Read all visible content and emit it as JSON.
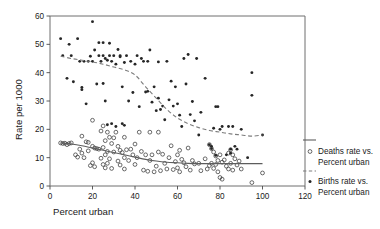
{
  "chart_data": {
    "type": "scatter",
    "title": "",
    "xlabel": "Percent urban",
    "ylabel": "Rate per 1000",
    "xlim": [
      0,
      120
    ],
    "ylim": [
      0,
      60
    ],
    "xticks": [
      0,
      20,
      40,
      60,
      80,
      100,
      120
    ],
    "yticks": [
      0,
      10,
      20,
      30,
      40,
      50,
      60
    ],
    "xtick_labels": [
      "0",
      "20",
      "40",
      "60",
      "80",
      "100",
      "120"
    ],
    "ytick_labels": [
      "0",
      "10",
      "20",
      "30",
      "40",
      "50",
      "60"
    ],
    "grid": false,
    "legend_position": "right",
    "series": [
      {
        "name": "Deaths rate vs. Percent urban",
        "marker": "open-circle",
        "line_style": "solid",
        "points": [
          [
            5,
            15.2
          ],
          [
            6,
            15.0
          ],
          [
            7,
            15.1
          ],
          [
            8,
            14.6
          ],
          [
            9,
            15.0
          ],
          [
            10,
            15.2
          ],
          [
            12,
            11.0
          ],
          [
            13,
            10.2
          ],
          [
            14,
            13.0
          ],
          [
            15,
            17.6
          ],
          [
            15,
            11.6
          ],
          [
            16,
            10.0
          ],
          [
            17,
            15.6
          ],
          [
            18,
            15.4
          ],
          [
            18,
            12.4
          ],
          [
            19,
            7.2
          ],
          [
            20,
            23.2
          ],
          [
            20,
            8.2
          ],
          [
            20,
            14.0
          ],
          [
            21,
            13.4
          ],
          [
            21,
            6.8
          ],
          [
            22,
            13.2
          ],
          [
            23,
            13.0
          ],
          [
            24,
            19.4
          ],
          [
            24,
            9.8
          ],
          [
            25,
            21.2
          ],
          [
            25,
            13.6
          ],
          [
            25,
            7.6
          ],
          [
            26,
            16.0
          ],
          [
            26,
            11.0
          ],
          [
            26,
            6.4
          ],
          [
            27,
            19.0
          ],
          [
            27,
            12.2
          ],
          [
            27,
            8.0
          ],
          [
            28,
            17.2
          ],
          [
            28,
            9.6
          ],
          [
            29,
            15.0
          ],
          [
            29,
            6.2
          ],
          [
            30,
            17.0
          ],
          [
            30,
            12.0
          ],
          [
            31,
            19.0
          ],
          [
            32,
            14.0
          ],
          [
            32,
            8.8
          ],
          [
            33,
            12.6
          ],
          [
            33,
            7.4
          ],
          [
            34,
            11.8
          ],
          [
            35,
            17.2
          ],
          [
            35,
            10.0
          ],
          [
            35,
            6.0
          ],
          [
            36,
            12.8
          ],
          [
            37,
            9.0
          ],
          [
            38,
            13.0
          ],
          [
            39,
            11.0
          ],
          [
            40,
            14.8
          ],
          [
            40,
            7.6
          ],
          [
            41,
            10.0
          ],
          [
            42,
            19.0
          ],
          [
            43,
            12.2
          ],
          [
            44,
            5.6
          ],
          [
            45,
            11.0
          ],
          [
            46,
            5.2
          ],
          [
            47,
            19.0
          ],
          [
            47,
            9.0
          ],
          [
            48,
            11.0
          ],
          [
            49,
            5.0
          ],
          [
            50,
            7.0
          ],
          [
            51,
            19.0
          ],
          [
            51,
            12.0
          ],
          [
            52,
            5.4
          ],
          [
            53,
            11.2
          ],
          [
            54,
            8.0
          ],
          [
            55,
            6.0
          ],
          [
            56,
            10.0
          ],
          [
            57,
            14.2
          ],
          [
            58,
            5.8
          ],
          [
            59,
            8.6
          ],
          [
            60,
            11.0
          ],
          [
            60,
            6.4
          ],
          [
            61,
            12.6
          ],
          [
            61,
            5.0
          ],
          [
            62,
            9.4
          ],
          [
            63,
            8.2
          ],
          [
            64,
            6.8
          ],
          [
            65,
            13.4
          ],
          [
            66,
            5.6
          ],
          [
            67,
            9.0
          ],
          [
            68,
            7.8
          ],
          [
            70,
            8.0
          ],
          [
            71,
            5.4
          ],
          [
            73,
            9.6
          ],
          [
            74,
            6.0
          ],
          [
            75,
            14.6
          ],
          [
            75,
            7.2
          ],
          [
            76,
            13.2
          ],
          [
            76,
            8.0
          ],
          [
            77,
            12.0
          ],
          [
            77,
            6.2
          ],
          [
            78,
            10.6
          ],
          [
            78,
            7.6
          ],
          [
            79,
            9.0
          ],
          [
            79,
            5.0
          ],
          [
            80,
            11.0
          ],
          [
            80,
            3.0
          ],
          [
            81,
            8.4
          ],
          [
            81,
            2.4
          ],
          [
            82,
            9.2
          ],
          [
            83,
            7.0
          ],
          [
            84,
            11.6
          ],
          [
            84,
            6.0
          ],
          [
            85,
            12.8
          ],
          [
            85,
            8.0
          ],
          [
            86,
            11.0
          ],
          [
            86,
            5.6
          ],
          [
            87,
            9.6
          ],
          [
            88,
            7.4
          ],
          [
            89,
            8.8
          ],
          [
            90,
            6.0
          ],
          [
            95,
            1.2
          ],
          [
            100,
            4.6
          ]
        ],
        "trend": [
          [
            5,
            15.2
          ],
          [
            10,
            14.8
          ],
          [
            15,
            14.2
          ],
          [
            20,
            13.4
          ],
          [
            25,
            12.6
          ],
          [
            30,
            11.8
          ],
          [
            35,
            11.0
          ],
          [
            40,
            10.2
          ],
          [
            45,
            9.4
          ],
          [
            50,
            8.8
          ],
          [
            55,
            8.4
          ],
          [
            60,
            8.2
          ],
          [
            65,
            8.0
          ],
          [
            70,
            7.9
          ],
          [
            75,
            7.9
          ],
          [
            80,
            7.9
          ],
          [
            85,
            7.9
          ],
          [
            90,
            7.9
          ],
          [
            95,
            7.9
          ],
          [
            100,
            7.9
          ]
        ]
      },
      {
        "name": "Births rate vs. Percent urban",
        "marker": "filled-dot",
        "line_style": "dashed",
        "points": [
          [
            5,
            52.0
          ],
          [
            6,
            46.0
          ],
          [
            8,
            38.0
          ],
          [
            9,
            50.0
          ],
          [
            10,
            46.0
          ],
          [
            11,
            36.8
          ],
          [
            13,
            52.0
          ],
          [
            14,
            44.0
          ],
          [
            15,
            34.0
          ],
          [
            15,
            34.8
          ],
          [
            16,
            44.0
          ],
          [
            17,
            29.0
          ],
          [
            18,
            44.0
          ],
          [
            19,
            45.8
          ],
          [
            20,
            58.0
          ],
          [
            20,
            44.0
          ],
          [
            21,
            48.0
          ],
          [
            22,
            36.0
          ],
          [
            23,
            50.6
          ],
          [
            23,
            46.0
          ],
          [
            24,
            44.0
          ],
          [
            25,
            50.6
          ],
          [
            25,
            46.0
          ],
          [
            25,
            36.2
          ],
          [
            26,
            45.0
          ],
          [
            26,
            30.0
          ],
          [
            27,
            44.4
          ],
          [
            27,
            21.6
          ],
          [
            28,
            50.4
          ],
          [
            28,
            46.0
          ],
          [
            29,
            44.0
          ],
          [
            29,
            22.0
          ],
          [
            30,
            46.0
          ],
          [
            31,
            43.0
          ],
          [
            31,
            21.0
          ],
          [
            32,
            48.2
          ],
          [
            33,
            45.6
          ],
          [
            33,
            46.0
          ],
          [
            34,
            22.0
          ],
          [
            34,
            35.0
          ],
          [
            35,
            43.6
          ],
          [
            35,
            21.4
          ],
          [
            36,
            46.0
          ],
          [
            37,
            30.0
          ],
          [
            38,
            44.0
          ],
          [
            39,
            33.0
          ],
          [
            40,
            43.0
          ],
          [
            41,
            46.0
          ],
          [
            42,
            28.0
          ],
          [
            43,
            45.0
          ],
          [
            44,
            44.0
          ],
          [
            45,
            33.2
          ],
          [
            46,
            33.4
          ],
          [
            46,
            44.0
          ],
          [
            47,
            48.0
          ],
          [
            48,
            29.6
          ],
          [
            49,
            35.0
          ],
          [
            50,
            26.6
          ],
          [
            51,
            31.0
          ],
          [
            51,
            43.8
          ],
          [
            52,
            27.0
          ],
          [
            53,
            28.2
          ],
          [
            54,
            23.4
          ],
          [
            55,
            44.0
          ],
          [
            56,
            30.4
          ],
          [
            57,
            37.0
          ],
          [
            58,
            28.2
          ],
          [
            59,
            35.0
          ],
          [
            60,
            29.0
          ],
          [
            61,
            25.0
          ],
          [
            62,
            21.0
          ],
          [
            63,
            45.0
          ],
          [
            64,
            36.0
          ],
          [
            65,
            46.4
          ],
          [
            66,
            25.2
          ],
          [
            67,
            29.8
          ],
          [
            68,
            23.0
          ],
          [
            69,
            45.0
          ],
          [
            70,
            18.0
          ],
          [
            71,
            26.0
          ],
          [
            73,
            38.0
          ],
          [
            75,
            14.6
          ],
          [
            76,
            14.0
          ],
          [
            76,
            13.2
          ],
          [
            77,
            20.4
          ],
          [
            78,
            28.0
          ],
          [
            78,
            10.8
          ],
          [
            79,
            28.0
          ],
          [
            80,
            20.0
          ],
          [
            81,
            21.0
          ],
          [
            83,
            11.0
          ],
          [
            84,
            21.0
          ],
          [
            85,
            11.6
          ],
          [
            85,
            13.0
          ],
          [
            86,
            21.0
          ],
          [
            87,
            14.0
          ],
          [
            88,
            13.0
          ],
          [
            90,
            20.0
          ],
          [
            93,
            10.0
          ],
          [
            95,
            40.0
          ],
          [
            95,
            32.0
          ],
          [
            100,
            18.0
          ]
        ],
        "trend": [
          [
            5,
            45.8
          ],
          [
            10,
            45.0
          ],
          [
            15,
            44.4
          ],
          [
            20,
            43.8
          ],
          [
            25,
            43.0
          ],
          [
            30,
            42.0
          ],
          [
            35,
            41.0
          ],
          [
            40,
            39.2
          ],
          [
            45,
            35.0
          ],
          [
            50,
            31.0
          ],
          [
            55,
            27.0
          ],
          [
            60,
            24.0
          ],
          [
            65,
            22.0
          ],
          [
            70,
            20.6
          ],
          [
            75,
            19.6
          ],
          [
            80,
            19.0
          ],
          [
            85,
            18.4
          ],
          [
            90,
            18.0
          ],
          [
            95,
            17.6
          ],
          [
            100,
            18.0
          ]
        ]
      }
    ]
  },
  "legend": {
    "entries": [
      {
        "label_line1": "Deaths rate vs.",
        "label_line2": "Percent urban",
        "marker": "open-circle",
        "line": "solid"
      },
      {
        "label_line1": "Births rate vs.",
        "label_line2": "Percent urban",
        "marker": "filled-dot",
        "line": "dashed"
      }
    ]
  },
  "colors": {
    "background": "#ffffff",
    "frame": "#6e6e6e",
    "deaths_marker": "#3a3a3a",
    "deaths_line": "#5d5d5d",
    "births_marker": "#262626",
    "births_line": "#7d7d7d",
    "text": "#1a1a1a"
  }
}
